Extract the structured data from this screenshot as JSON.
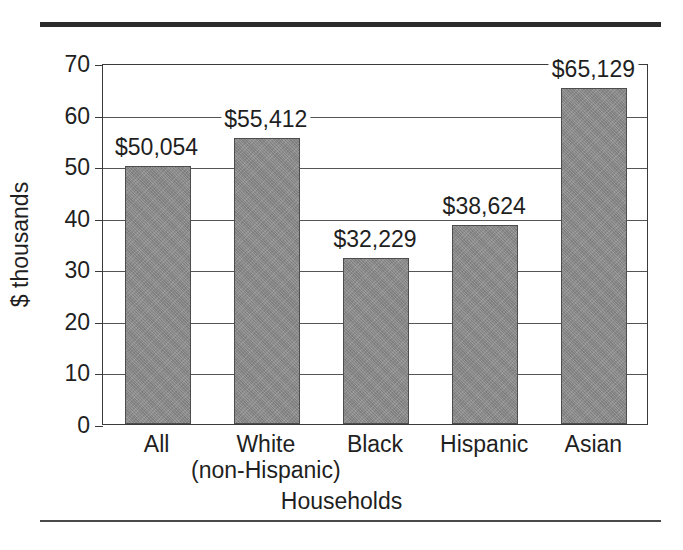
{
  "figure": {
    "background_color": "#ffffff",
    "rule_top_color": "#2b2b2b",
    "rule_bottom_color": "#4a4a4a",
    "bar_fill_color": "#8a8a8a",
    "bar_edge_color": "#4d4d4d",
    "gridline_color": "#555555",
    "axis_color": "#3a3a3a",
    "text_color": "#1f1f1f"
  },
  "chart_data": {
    "type": "bar",
    "title": "",
    "subtitle": "",
    "xlabel": "Households",
    "ylabel": "$ thousands",
    "categories": [
      "All",
      "White\n(non-Hispanic)",
      "Black",
      "Hispanic",
      "Asian"
    ],
    "category_labels": [
      {
        "line1": "All",
        "line2": ""
      },
      {
        "line1": "White",
        "line2": "(non-Hispanic)"
      },
      {
        "line1": "Black",
        "line2": ""
      },
      {
        "line1": "Hispanic",
        "line2": ""
      },
      {
        "line1": "Asian",
        "line2": ""
      }
    ],
    "values": [
      50.054,
      55.412,
      32.229,
      38.624,
      65.129
    ],
    "value_labels": [
      "$50,054",
      "$55,412",
      "$32,229",
      "$38,624",
      "$65,129"
    ],
    "ylim": [
      0,
      70
    ],
    "yticks": [
      0,
      10,
      20,
      30,
      40,
      50,
      60,
      70
    ],
    "ytick_labels": [
      "0",
      "10",
      "20",
      "30",
      "40",
      "50",
      "60",
      "70"
    ],
    "grid": true,
    "grid_axis": "y",
    "legend": false,
    "legend_position": "none",
    "units": "thousands of dollars"
  }
}
